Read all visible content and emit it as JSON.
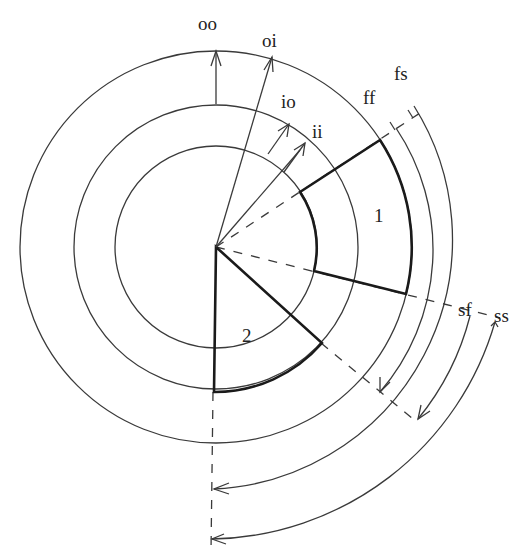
{
  "diagram": {
    "center": {
      "x": 216,
      "y": 247
    },
    "circles": [
      {
        "name": "inner",
        "r": 101
      },
      {
        "name": "middle",
        "r": 142
      },
      {
        "name": "outer",
        "r": 196
      }
    ],
    "labels": {
      "oo": "oo",
      "oi": "oi",
      "io": "io",
      "ii": "ii",
      "ff": "ff",
      "fs": "fs",
      "sf": "sf",
      "ss": "ss",
      "sector1": "1",
      "sector2": "2"
    },
    "sectors": [
      {
        "id": "1",
        "r_inner": 101,
        "r_outer": 196,
        "start_angle_deg": -33,
        "end_angle_deg": 14
      },
      {
        "id": "2",
        "r_inner": 0,
        "r_outer": 142,
        "start_angle_deg": 40,
        "end_angle_deg": 90
      }
    ],
    "radial_arrows": [
      {
        "label": "oo",
        "from": "middle circle",
        "to": "outer circle"
      },
      {
        "label": "oi",
        "from": "center",
        "to": "outer circle"
      },
      {
        "label": "io",
        "from": "inner circle",
        "to": "middle circle"
      },
      {
        "label": "ii",
        "from": "center direction",
        "to": "inner region"
      }
    ],
    "angular_arrows": [
      {
        "label": "ff",
        "r": 218
      },
      {
        "label": "fs",
        "r": 245
      },
      {
        "label": "sf",
        "r": 266
      },
      {
        "label": "ss",
        "r": 292
      }
    ],
    "colors": {
      "line": "#3a3a3a",
      "thick": "#1a1a1a",
      "background": "#ffffff"
    }
  }
}
